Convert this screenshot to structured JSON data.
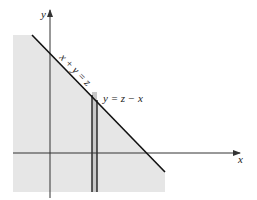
{
  "diagram": {
    "axes": {
      "x_label": "x",
      "y_label": "y"
    },
    "line_label": "x + y = z",
    "strip_label": "y = z − x",
    "colors": {
      "shade": "#e6e6e6",
      "line": "#111111",
      "axis": "#333333"
    }
  }
}
